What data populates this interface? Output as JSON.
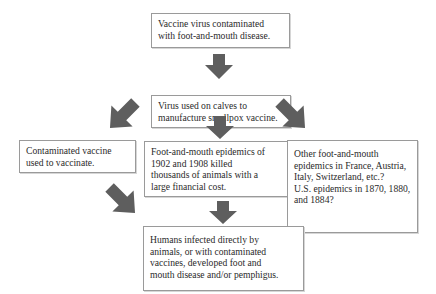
{
  "diagram": {
    "type": "flowchart",
    "colors": {
      "arrow": "#5e5e5e",
      "box_border": "#9a9a9a",
      "text": "#2a2a2a",
      "background": "#ffffff"
    },
    "nodes": [
      {
        "id": "vaccine-contaminated",
        "text": "Vaccine virus contaminated\nwith foot-and-mouth  disease."
      },
      {
        "id": "virus-used-on-calves",
        "text": "Virus used on calves to\nmanufacture smallpox vaccine."
      },
      {
        "id": "contaminated-vaccine-used",
        "text": "Contaminated vaccine\nused to vaccinate."
      },
      {
        "id": "epidemics-1902-1908",
        "text": "Foot-and-mouth  epidemics of\n1902 and 1908 killed\nthousands of animals with a\nlarge financial cost."
      },
      {
        "id": "other-epidemics",
        "text": "Other foot-and-mouth\nepidemics in France, Austria,\nItaly, Switzerland, etc.?\nU.S. epidemics in 1870, 1880,\nand 1884?"
      },
      {
        "id": "humans-infected",
        "text": "Humans infected directly by\nanimals, or with contaminated\nvaccines, developed foot and\nmouth disease and/or pemphigus."
      }
    ],
    "edges": [
      {
        "from": "vaccine-contaminated",
        "to": "virus-used-on-calves",
        "direction": "down"
      },
      {
        "from": "virus-used-on-calves",
        "to": "contaminated-vaccine-used",
        "direction": "down-left"
      },
      {
        "from": "virus-used-on-calves",
        "to": "epidemics-1902-1908",
        "direction": "down"
      },
      {
        "from": "virus-used-on-calves",
        "to": "other-epidemics",
        "direction": "down-right"
      },
      {
        "from": "contaminated-vaccine-used",
        "to": "humans-infected",
        "direction": "down-right"
      },
      {
        "from": "epidemics-1902-1908",
        "to": "humans-infected",
        "direction": "down"
      }
    ]
  }
}
